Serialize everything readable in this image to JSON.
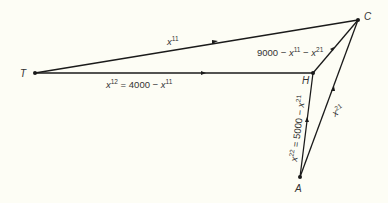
{
  "diagram": {
    "type": "network-flow",
    "colors": {
      "background": "#fdfdf5",
      "edge": "#1a1a1a",
      "text": "#333333"
    },
    "nodes": [
      {
        "id": "T",
        "label": "T",
        "x": 35,
        "y": 73
      },
      {
        "id": "H",
        "label": "H",
        "x": 313,
        "y": 73
      },
      {
        "id": "C",
        "label": "C",
        "x": 358,
        "y": 20
      },
      {
        "id": "A",
        "label": "A",
        "x": 300,
        "y": 177
      }
    ],
    "edges": [
      {
        "from": "T",
        "to": "C",
        "label_var": "x",
        "label_sup": "11",
        "label_rest": ""
      },
      {
        "from": "T",
        "to": "H",
        "label_var": "x",
        "label_sup": "12",
        "label_rest": " = 4000 − ",
        "label_var2": "x",
        "label_sup2": "11"
      },
      {
        "from": "H",
        "to": "C",
        "label_pre": "9000 − ",
        "label_var": "x",
        "label_sup": "11",
        "label_mid": " − ",
        "label_var2": "x",
        "label_sup2": "21"
      },
      {
        "from": "A",
        "to": "H",
        "label_var": "x",
        "label_sup": "22",
        "label_rest": " = 5000 − ",
        "label_var2": "x",
        "label_sup2": "21"
      },
      {
        "from": "A",
        "to": "C",
        "label_var": "x",
        "label_sup": "21"
      }
    ]
  }
}
